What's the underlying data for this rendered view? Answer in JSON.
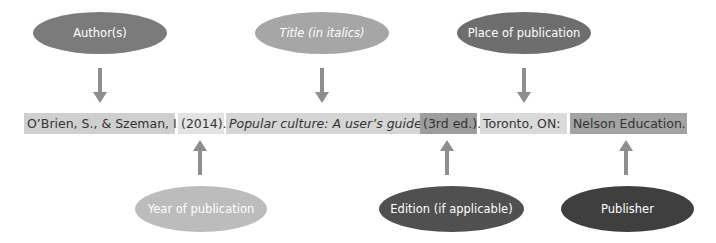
{
  "top_labels": [
    {
      "id": "author",
      "label": "Author(s)",
      "italic": false,
      "color": "#7b7b7b"
    },
    {
      "id": "title",
      "label": "Title (in italics)",
      "italic": true,
      "color": "#a6a6a6"
    },
    {
      "id": "place",
      "label": "Place of publication",
      "color": "#6e6e6e",
      "italic": false
    }
  ],
  "bottom_labels": [
    {
      "id": "year",
      "label": "Year of publication",
      "italic": false,
      "color": "#bcbcbc"
    },
    {
      "id": "edition",
      "label": "Edition (if applicable)",
      "italic": false,
      "color": "#505050"
    },
    {
      "id": "publisher",
      "label": "Publisher",
      "italic": false,
      "color": "#3f3f3f"
    }
  ],
  "citation": {
    "segments": [
      {
        "id": "author",
        "text": "O’Brien, S., & Szeman, I.",
        "italic": false,
        "bg": "#cfcfcf"
      },
      {
        "id": "year",
        "text": "(2014).",
        "italic": false,
        "bg": "#e3e3e3"
      },
      {
        "id": "title",
        "text": "Popular culture: A user’s guide",
        "italic": true,
        "bg": "#d5d5d5"
      },
      {
        "id": "edition",
        "text": "(3rd ed.).",
        "italic": false,
        "bg": "#9d9d9d"
      },
      {
        "id": "place",
        "text": "Toronto, ON:",
        "italic": false,
        "bg": "#dadada"
      },
      {
        "id": "publisher",
        "text": "Nelson Education.",
        "italic": false,
        "bg": "#a3a3a3"
      }
    ]
  },
  "colors": {
    "arrow": "#8e8e8e",
    "ellipse_text": "#ffffff",
    "citation_text": "#333333"
  }
}
